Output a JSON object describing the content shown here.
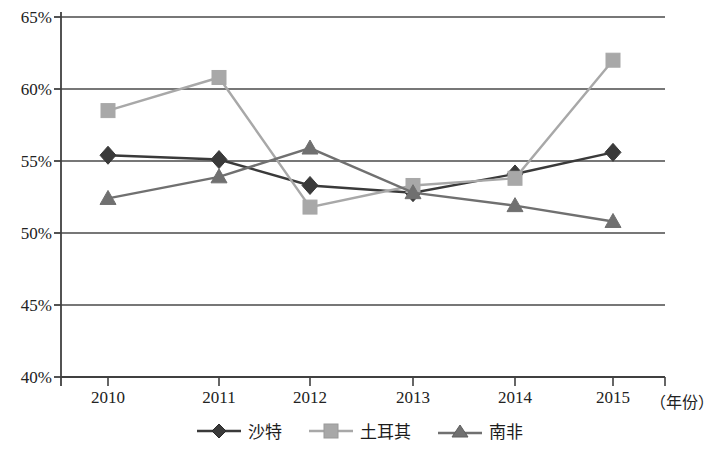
{
  "chart_data": {
    "type": "line",
    "title": "",
    "xlabel": "（年份）",
    "ylabel": "",
    "categories": [
      "2010",
      "2011",
      "2012",
      "2013",
      "2014",
      "2015"
    ],
    "ylim": [
      40,
      65
    ],
    "ytick_labels": [
      "40%",
      "45%",
      "50%",
      "55%",
      "60%",
      "65%"
    ],
    "ytick_values": [
      40,
      45,
      50,
      55,
      60,
      65
    ],
    "ytick_step": 5,
    "grid": true,
    "grid_axis": "y",
    "legend_position": "bottom",
    "series": [
      {
        "name": "沙特",
        "marker": "diamond",
        "color": "#3a3a3a",
        "values": [
          55.4,
          55.1,
          53.3,
          52.8,
          54.1,
          55.6
        ]
      },
      {
        "name": "土耳其",
        "marker": "square",
        "color": "#a8a8a8",
        "values": [
          58.5,
          60.8,
          51.8,
          53.3,
          53.8,
          62.0
        ]
      },
      {
        "name": "南非",
        "marker": "triangle",
        "color": "#707070",
        "values": [
          52.4,
          53.9,
          55.9,
          52.8,
          51.9,
          50.8
        ]
      }
    ]
  },
  "axis": {
    "x_unit_label": "（年份）"
  },
  "colors": {
    "axis": "#404040",
    "grid": "#4a4a4a",
    "saudi": "#3a3a3a",
    "turkey": "#a8a8a8",
    "south_africa": "#707070",
    "background": "#ffffff"
  }
}
